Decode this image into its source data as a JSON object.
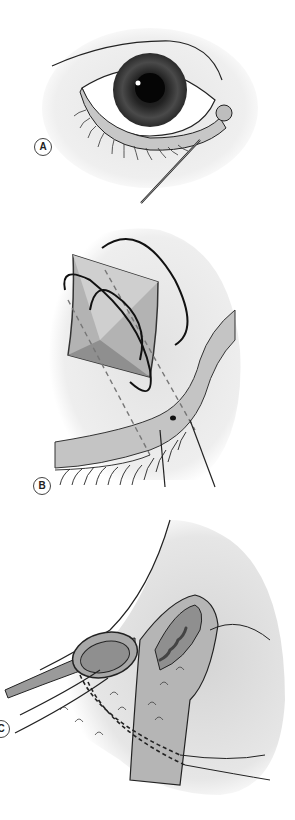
{
  "figure": {
    "panels": [
      {
        "id": "A",
        "label": "A",
        "description": "Eye with probe inserted into the lower lacrimal punctum"
      },
      {
        "id": "B",
        "label": "B",
        "description": "Close-up of lower lid margin with suture loops through a bolster pad"
      },
      {
        "id": "C",
        "label": "C",
        "description": "Cross-section of eyelid and canaliculus with stent and sutures"
      }
    ],
    "caption_fragment": "",
    "colors": {
      "background": "#ffffff",
      "shading": "#e6e6e6",
      "tissue": "#bdbdbd",
      "tissue_dark": "#8f8f8f",
      "line": "#1a1a1a"
    }
  }
}
